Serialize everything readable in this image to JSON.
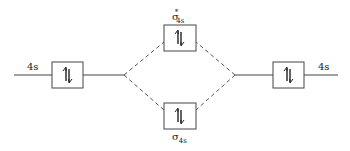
{
  "diagram": {
    "type": "molecular-orbital-diagram",
    "colors": {
      "stroke": "#444444",
      "text": "#222222",
      "background": "#ffffff"
    },
    "atomic_orbitals": {
      "left": {
        "label": "4s",
        "electrons": "↑↓"
      },
      "right": {
        "label": "4s",
        "electrons": "↑↓"
      }
    },
    "molecular_orbitals": {
      "antibonding": {
        "symbol": "σ",
        "superscript": "*",
        "subscript": "4s",
        "electrons": "↑↓"
      },
      "bonding": {
        "symbol": "σ",
        "subscript": "4s",
        "electrons": "↑↓"
      }
    },
    "connectors": {
      "style": "dashed"
    }
  }
}
